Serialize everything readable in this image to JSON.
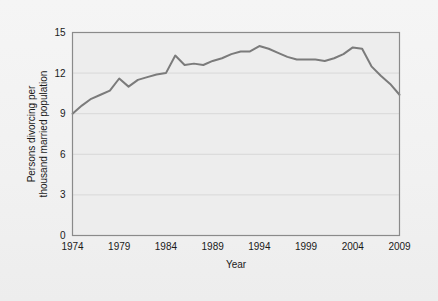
{
  "figure": {
    "background_color": "#f1f1f1",
    "plot_background_color": "#ededed",
    "border_color": "#8a8a8a",
    "grid_color": "#d8d8d8",
    "line_color": "#7b7b7b",
    "text_color": "#1a1a1a"
  },
  "chart_data": {
    "type": "line",
    "title": "",
    "xlabel": "Year",
    "ylabel_line1": "Persons divorcing per",
    "ylabel_line2": "thousand married population",
    "ylabel": "Persons divorcing per thousand married population",
    "xlim": [
      1974,
      2009
    ],
    "ylim": [
      0,
      15
    ],
    "xticks": [
      1974,
      1979,
      1984,
      1989,
      1994,
      1999,
      2004,
      2009
    ],
    "xtick_labels": [
      "1974",
      "1979",
      "1984",
      "1989",
      "1994",
      "1999",
      "2004",
      "2009"
    ],
    "yticks": [
      0,
      3,
      6,
      9,
      12,
      15
    ],
    "ytick_labels": [
      "0",
      "3",
      "6",
      "9",
      "12",
      "15"
    ],
    "grid": "horizontal",
    "legend": "none",
    "series": [
      {
        "name": "Persons divorcing per thousand married population",
        "x": [
          1974,
          1975,
          1976,
          1977,
          1978,
          1979,
          1980,
          1981,
          1982,
          1983,
          1984,
          1985,
          1986,
          1987,
          1988,
          1989,
          1990,
          1991,
          1992,
          1993,
          1994,
          1995,
          1996,
          1997,
          1998,
          1999,
          2000,
          2001,
          2002,
          2003,
          2004,
          2005,
          2006,
          2007,
          2008,
          2009
        ],
        "values": [
          9.0,
          9.6,
          10.1,
          10.4,
          10.6,
          11.6,
          11.0,
          11.4,
          11.6,
          11.8,
          11.9,
          12.0,
          12.1,
          12.0,
          13.3,
          12.7,
          12.6,
          12.7,
          12.5,
          12.9,
          13.1,
          13.4,
          13.6,
          13.6,
          13.9,
          14.1,
          13.7,
          13.5,
          13.2,
          13.2,
          13.2,
          13.1,
          13.4,
          13.9,
          14.0,
          13.9
        ],
        "values_note": "values read from chart gridlines, rounded to 0.1"
      }
    ],
    "data_points": [
      {
        "year": 1974,
        "rate": 9.0
      },
      {
        "year": 1975,
        "rate": 9.6
      },
      {
        "year": 1976,
        "rate": 10.1
      },
      {
        "year": 1977,
        "rate": 10.4
      },
      {
        "year": 1978,
        "rate": 10.7
      },
      {
        "year": 1979,
        "rate": 11.6
      },
      {
        "year": 1980,
        "rate": 11.0
      },
      {
        "year": 1981,
        "rate": 11.5
      },
      {
        "year": 1982,
        "rate": 11.7
      },
      {
        "year": 1983,
        "rate": 11.9
      },
      {
        "year": 1984,
        "rate": 12.0
      },
      {
        "year": 1985,
        "rate": 13.3
      },
      {
        "year": 1986,
        "rate": 12.6
      },
      {
        "year": 1987,
        "rate": 12.7
      },
      {
        "year": 1988,
        "rate": 12.6
      },
      {
        "year": 1989,
        "rate": 12.9
      },
      {
        "year": 1990,
        "rate": 13.1
      },
      {
        "year": 1991,
        "rate": 13.4
      },
      {
        "year": 1992,
        "rate": 13.6
      },
      {
        "year": 1993,
        "rate": 13.6
      },
      {
        "year": 1994,
        "rate": 14.0
      },
      {
        "year": 1995,
        "rate": 13.8
      },
      {
        "year": 1996,
        "rate": 13.5
      },
      {
        "year": 1997,
        "rate": 13.2
      },
      {
        "year": 1998,
        "rate": 13.0
      },
      {
        "year": 1999,
        "rate": 13.0
      },
      {
        "year": 2000,
        "rate": 13.0
      },
      {
        "year": 2001,
        "rate": 12.9
      },
      {
        "year": 2002,
        "rate": 13.1
      },
      {
        "year": 2003,
        "rate": 13.4
      },
      {
        "year": 2004,
        "rate": 13.9
      },
      {
        "year": 2005,
        "rate": 13.8
      },
      {
        "year": 2006,
        "rate": 12.5
      },
      {
        "year": 2007,
        "rate": 11.8
      },
      {
        "year": 2008,
        "rate": 11.2
      },
      {
        "year": 2009,
        "rate": 10.4
      }
    ]
  }
}
